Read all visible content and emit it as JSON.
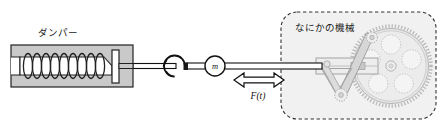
{
  "figure": {
    "title_alt": "mass-damper-machine schematic",
    "background_color": "#ffffff"
  },
  "damper": {
    "label": "ダンパー",
    "body_fill": "#c9c9c9",
    "stroke": "#222222",
    "coil_count": 9,
    "label_x": 38,
    "label_y": 36
  },
  "mass": {
    "label": "m",
    "cx": 215,
    "cy": 66,
    "r": 10,
    "fill": "#ffffff",
    "stroke": "#111111"
  },
  "force": {
    "label": "F(t)",
    "arrow_type": "double-headed-hollow",
    "label_x": 258,
    "label_y": 98,
    "arrow_cy": 80,
    "arrow_x1": 234,
    "arrow_x2": 284
  },
  "hook": {
    "name": "spiral-hook",
    "cx": 175,
    "cy": 66,
    "r": 11
  },
  "machine": {
    "label": "なにかの機械",
    "box": {
      "x": 281,
      "y": 12,
      "width": 155,
      "height": 107,
      "radius": 16,
      "fill": "#f0f0f0",
      "border_color": "#333333",
      "border_style": "dashed"
    },
    "label_x": 295,
    "label_y": 30,
    "gear": {
      "cx": 391,
      "cy": 66,
      "radius": 40,
      "teeth": 68,
      "hub_radius": 5,
      "cutout_count": 5,
      "cutout_radius": 9.5,
      "fill": "#e4e4e4",
      "stroke": "#a8a8a8"
    },
    "linkage": {
      "slider_x": 316,
      "slider_y": 58,
      "slider_width": 62,
      "slider_height": 16,
      "crank_pin_cx": 375,
      "crank_pin_cy": 39,
      "rocker_pivot_cx": 339,
      "rocker_pivot_cy": 94,
      "stroke": "#b0b0b0"
    }
  },
  "rod": {
    "y": 66,
    "from_x": 128,
    "to_x": 322,
    "fill": "#ffffff",
    "stroke": "#111111"
  }
}
